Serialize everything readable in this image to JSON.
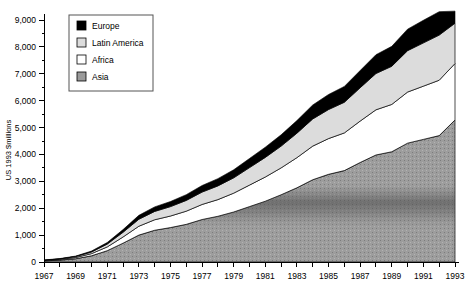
{
  "chart_data": {
    "type": "area",
    "stacked": true,
    "title": "",
    "subtitle": "",
    "xlabel": "",
    "ylabel": "US 1993 $millions",
    "ylim": [
      0,
      9000
    ],
    "xlim": [
      1967,
      1993
    ],
    "grid": false,
    "legend_position": "top-left-inside",
    "y_ticks": [
      0,
      1000,
      2000,
      3000,
      4000,
      5000,
      6000,
      7000,
      8000,
      9000
    ],
    "y_tick_labels": [
      "0",
      "1,000",
      "2,000",
      "3,000",
      "4,000",
      "5,000",
      "6,000",
      "7,000",
      "8,000",
      "9,000"
    ],
    "y_minor_tick_step": 500,
    "x_ticks": [
      1967,
      1968,
      1969,
      1970,
      1971,
      1972,
      1973,
      1974,
      1975,
      1976,
      1977,
      1978,
      1979,
      1980,
      1981,
      1982,
      1983,
      1984,
      1985,
      1986,
      1987,
      1988,
      1989,
      1990,
      1991,
      1992,
      1993
    ],
    "x_tick_labels_shown": [
      "1967",
      "1969",
      "1971",
      "1973",
      "1975",
      "1977",
      "1979",
      "1981",
      "1983",
      "1985",
      "1987",
      "1989",
      "1991",
      "1993"
    ],
    "x": [
      1967,
      1968,
      1969,
      1970,
      1971,
      1972,
      1973,
      1974,
      1975,
      1976,
      1977,
      1978,
      1979,
      1980,
      1981,
      1982,
      1983,
      1984,
      1985,
      1986,
      1987,
      1988,
      1989,
      1990,
      1991,
      1992,
      1993
    ],
    "stack_order_bottom_to_top": [
      "Asia",
      "Africa",
      "Latin America",
      "Europe"
    ],
    "series": [
      {
        "name": "Asia",
        "color": "#9a9a9a",
        "pattern": "dense-gray",
        "values": [
          40,
          70,
          120,
          230,
          420,
          700,
          1000,
          1180,
          1280,
          1400,
          1580,
          1700,
          1860,
          2060,
          2260,
          2500,
          2760,
          3060,
          3260,
          3400,
          3700,
          3980,
          4100,
          4420,
          4560,
          4700,
          5280
        ]
      },
      {
        "name": "Africa",
        "color": "#ffffff",
        "pattern": "solid-white",
        "values": [
          15,
          25,
          45,
          80,
          140,
          230,
          330,
          390,
          430,
          490,
          560,
          620,
          700,
          800,
          900,
          1000,
          1120,
          1250,
          1330,
          1400,
          1540,
          1680,
          1760,
          1900,
          1980,
          2060,
          2100
        ]
      },
      {
        "name": "Latin America",
        "color": "#dcdcdc",
        "pattern": "light-gray",
        "values": [
          12,
          20,
          35,
          60,
          105,
          175,
          260,
          310,
          350,
          400,
          460,
          510,
          570,
          650,
          730,
          810,
          910,
          1010,
          1080,
          1140,
          1240,
          1350,
          1420,
          1540,
          1610,
          1680,
          1500
        ]
      },
      {
        "name": "Europe",
        "color": "#000000",
        "pattern": "solid-black",
        "values": [
          8,
          12,
          20,
          35,
          60,
          100,
          145,
          170,
          190,
          215,
          245,
          270,
          300,
          340,
          380,
          420,
          470,
          520,
          560,
          590,
          640,
          700,
          740,
          800,
          840,
          870,
          450
        ]
      }
    ],
    "totals": [
      75,
      127,
      220,
      405,
      725,
      1205,
      1735,
      2050,
      2250,
      2505,
      2845,
      3100,
      3430,
      3850,
      4270,
      4730,
      5260,
      5840,
      6230,
      6530,
      7120,
      7710,
      8020,
      8660,
      8990,
      9310,
      9330
    ]
  },
  "axes": {
    "y_axis_title": "US 1993 $millions",
    "y_labels": [
      "9,000",
      "8,000",
      "7,000",
      "6,000",
      "5,000",
      "4,000",
      "3,000",
      "2,000",
      "1,000",
      "0"
    ],
    "x_labels": [
      "1967",
      "1969",
      "1971",
      "1973",
      "1975",
      "1977",
      "1979",
      "1981",
      "1983",
      "1985",
      "1987",
      "1989",
      "1991",
      "1993"
    ]
  },
  "legend": {
    "items": [
      {
        "label": "Europe",
        "swatch_color": "#000000"
      },
      {
        "label": "Latin America",
        "swatch_color": "#dcdcdc"
      },
      {
        "label": "Africa",
        "swatch_color": "#ffffff"
      },
      {
        "label": "Asia",
        "swatch_color": "#9a9a9a"
      }
    ]
  }
}
